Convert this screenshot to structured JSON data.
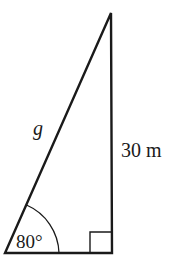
{
  "diagram": {
    "type": "right-triangle",
    "labels": {
      "hypotenuse": "g",
      "vertical_side": "30 m",
      "angle": "80°"
    },
    "right_angle_marker": true,
    "colors": {
      "stroke": "#1a1a1a",
      "background": "#ffffff"
    }
  }
}
